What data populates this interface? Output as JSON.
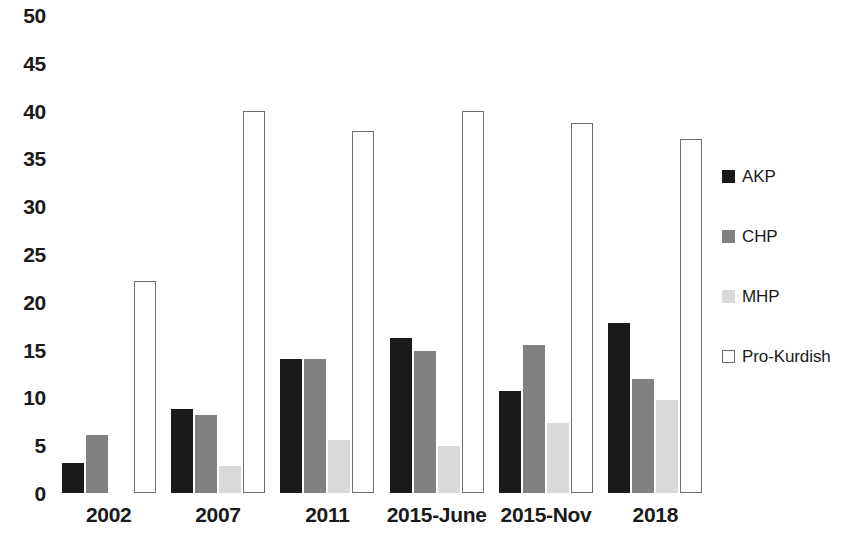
{
  "chart_data": {
    "type": "bar",
    "title": "",
    "subtitle": "",
    "xlabel": "",
    "ylabel": "",
    "categories": [
      "2002",
      "2007",
      "2011",
      "2015-June",
      "2015-Nov",
      "2018"
    ],
    "series": [
      {
        "name": "AKP",
        "color": "#1a1a1a",
        "values": [
          3.1,
          8.8,
          14.0,
          16.2,
          10.7,
          17.8
        ]
      },
      {
        "name": "CHP",
        "color": "#808080",
        "values": [
          6.1,
          8.2,
          14.0,
          14.9,
          15.5,
          11.9
        ]
      },
      {
        "name": "MHP",
        "color": "#d9d9d9",
        "values": [
          0,
          2.8,
          5.5,
          4.9,
          7.3,
          9.7
        ]
      },
      {
        "name": "Pro-Kurdish",
        "color": "#ffffff",
        "border_color": "#707070",
        "values": [
          22.2,
          40.0,
          37.9,
          40.0,
          38.7,
          37.0
        ]
      }
    ],
    "ylim": [
      0,
      50
    ],
    "ytick_step": 5,
    "yticks": [
      0,
      5,
      10,
      15,
      20,
      25,
      30,
      35,
      40,
      45,
      50
    ],
    "ytick_labels": [
      "0",
      "5",
      "10",
      "15",
      "20",
      "25",
      "30",
      "35",
      "40",
      "45",
      "50"
    ],
    "grid": false,
    "legend_position": "right",
    "legend_entries": [
      "AKP",
      "CHP",
      "MHP",
      "Pro-Kurdish"
    ]
  }
}
